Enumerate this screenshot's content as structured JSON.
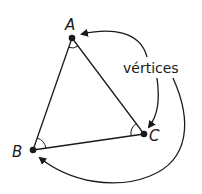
{
  "diagram": {
    "type": "triangle-vertices",
    "stroke_color": "#1a1a1a",
    "background": "#ffffff",
    "vertices": [
      {
        "name": "A",
        "label": "A",
        "x": 72,
        "y": 38
      },
      {
        "name": "B",
        "label": "B",
        "x": 33,
        "y": 150
      },
      {
        "name": "C",
        "label": "C",
        "x": 144,
        "y": 134
      }
    ],
    "annotation": {
      "label": "vértices",
      "points_to": [
        "A",
        "C",
        "B"
      ]
    },
    "angle_marks": [
      "A",
      "B",
      "C"
    ]
  }
}
